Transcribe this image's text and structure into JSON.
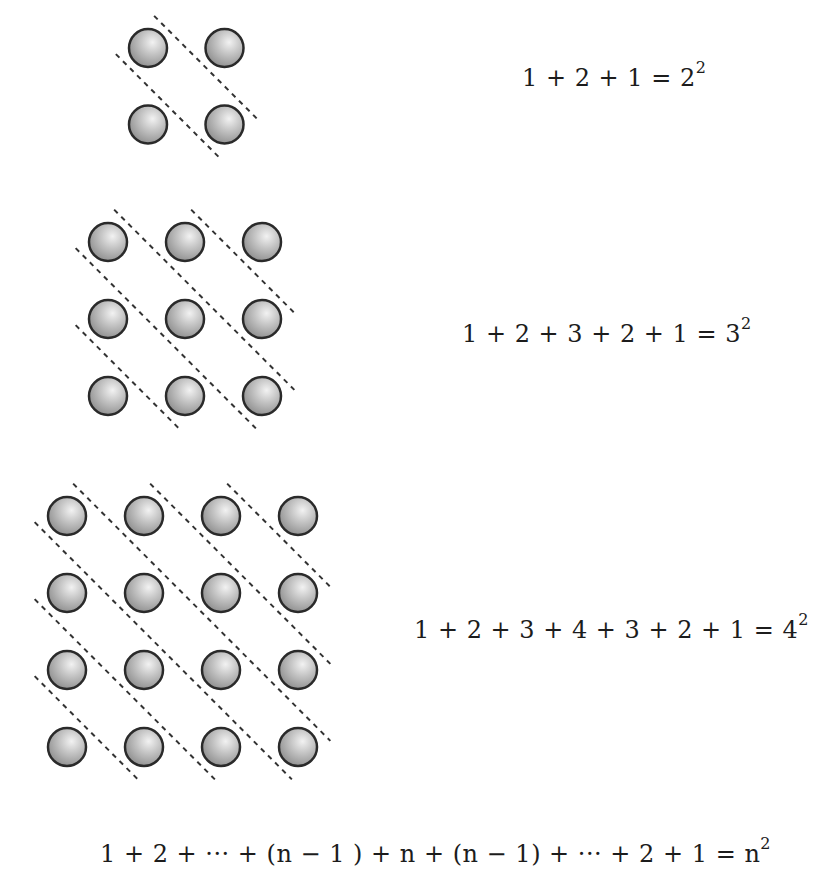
{
  "figure": {
    "grids": [
      {
        "size": 2,
        "diagonal_counts": [
          1,
          2,
          1
        ]
      },
      {
        "size": 3,
        "diagonal_counts": [
          1,
          2,
          3,
          2,
          1
        ]
      },
      {
        "size": 4,
        "diagonal_counts": [
          1,
          2,
          3,
          4,
          3,
          2,
          1
        ]
      }
    ],
    "colors": {
      "circle_fill": "#b8b8b8",
      "circle_stroke": "#2a2a2a",
      "dash": "#333333",
      "background": "#ffffff"
    }
  },
  "equations": {
    "eq1": {
      "lhs": "1 + 2 + 1 = 2",
      "exp": "2"
    },
    "eq2": {
      "lhs": "1 + 2 + 3 + 2 + 1  =  3",
      "exp": "2"
    },
    "eq3": {
      "lhs": "1 + 2 + 3 + 4 + 3 + 2 + 1  =  4",
      "exp": "2"
    },
    "general": {
      "lhs": "1 + 2 + ··· + (n − 1 ) + n + (n − 1) + ··· + 2 + 1  =  n",
      "exp": "2"
    }
  }
}
